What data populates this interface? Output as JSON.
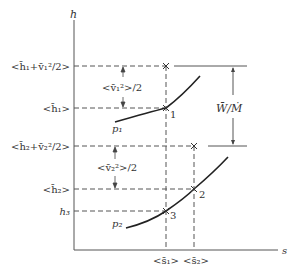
{
  "axes": {
    "y_label": "h",
    "x_label": "s"
  },
  "levels": {
    "h1_total": "<h̄₁+v̄₁²/2>",
    "h1": "<h̄₁>",
    "h2_total": "<h̄₂+v̄₂²/2>",
    "h2": "<h̄₂>",
    "h3": "h₃"
  },
  "intervals": {
    "ke1": "<v̄₁²>/2",
    "ke2": "<v̄₂²>/2",
    "work": "W̄/Ṁ"
  },
  "s_ticks": {
    "s1": "<s̄₁>",
    "s2": "<s̄₂>"
  },
  "curves": {
    "p1": "p₁",
    "p2": "p₂"
  },
  "points": {
    "pt1": "1",
    "pt2": "2",
    "pt3": "3"
  },
  "colors": {
    "line": "#333333",
    "dash": "#555555"
  }
}
